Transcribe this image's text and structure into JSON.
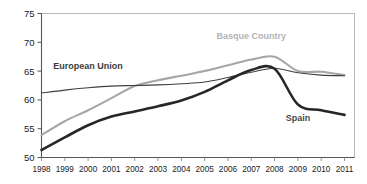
{
  "chart_data": {
    "type": "line",
    "title": "",
    "subtitle": "",
    "xlabel": "",
    "ylabel": "",
    "categories": [
      "1998",
      "1999",
      "2000",
      "2001",
      "2002",
      "2003",
      "2004",
      "2005",
      "2006",
      "2007",
      "2008",
      "2009",
      "2010",
      "2011"
    ],
    "x": [
      1998,
      1999,
      2000,
      2001,
      2002,
      2003,
      2004,
      2005,
      2006,
      2007,
      2008,
      2009,
      2010,
      2011
    ],
    "ylim": [
      50,
      75
    ],
    "xlim": [
      1998,
      2011
    ],
    "yticks": [
      50,
      55,
      60,
      65,
      70,
      75
    ],
    "ytick_labels": [
      "50",
      "55",
      "60",
      "65",
      "70",
      "75"
    ],
    "grid": false,
    "legend_position": "inline-annotations",
    "series": [
      {
        "name": "European Union",
        "color": "#3f3f3f",
        "values": [
          61.2,
          61.7,
          62.1,
          62.4,
          62.5,
          62.6,
          62.8,
          63.1,
          63.9,
          64.8,
          65.5,
          64.7,
          64.3,
          64.2
        ],
        "label_x": 2000,
        "label_y": 65.4
      },
      {
        "name": "Basque Country",
        "color": "#a6a6a6",
        "values": [
          53.9,
          56.3,
          58.2,
          60.3,
          62.4,
          63.4,
          64.2,
          65.0,
          66.0,
          67.0,
          67.5,
          65.0,
          64.9,
          64.3
        ],
        "label_x": 2007,
        "label_y": 70.6
      },
      {
        "name": "Spain",
        "color": "#262626",
        "values": [
          51.3,
          53.5,
          55.6,
          57.1,
          58.0,
          58.9,
          59.9,
          61.4,
          63.4,
          65.2,
          65.4,
          59.2,
          58.2,
          57.4
        ],
        "label_x": 2009,
        "label_y": 56.3
      }
    ],
    "annotations": [
      {
        "text": "European Union",
        "series": "European Union"
      },
      {
        "text": "Basque Country",
        "series": "Basque Country"
      },
      {
        "text": "Spain",
        "series": "Spain"
      }
    ]
  }
}
